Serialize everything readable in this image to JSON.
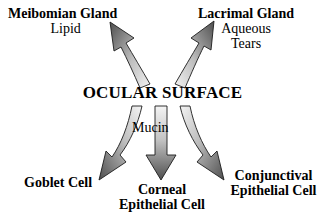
{
  "diagram": {
    "title": "OCULAR SURFACE",
    "center": {
      "label": "OCULAR SURFACE",
      "x": 162,
      "y": 92
    },
    "background_color": "#ffffff",
    "text_color": "#000000",
    "arrow_dark_color": "#4a4a4a",
    "arrow_light_color": "#e8e8e8",
    "arrow_outline_color": "#1a1a1a",
    "nodes": [
      {
        "id": "meibomian-gland",
        "name": "Meibomian Gland",
        "secretion": "Lipid",
        "position": "top-left",
        "direction": "up-left"
      },
      {
        "id": "lacrimal-gland",
        "name": "Lacrimal Gland",
        "secretion_line1": "Aqueous",
        "secretion_line2": "Tears",
        "position": "top-right",
        "direction": "up-right"
      },
      {
        "id": "goblet-cell",
        "name": "Goblet Cell",
        "position": "bottom-left",
        "direction": "down-left"
      },
      {
        "id": "corneal-epithelial-cell",
        "name_line1": "Corneal",
        "name_line2": "Epithelial Cell",
        "position": "bottom-center",
        "direction": "down"
      },
      {
        "id": "conjunctival-epithelial-cell",
        "name_line1": "Conjunctival",
        "name_line2": "Epithelial Cell",
        "position": "bottom-right",
        "direction": "down-right"
      }
    ],
    "mucin_label": "Mucin",
    "arrow_count": 5
  }
}
